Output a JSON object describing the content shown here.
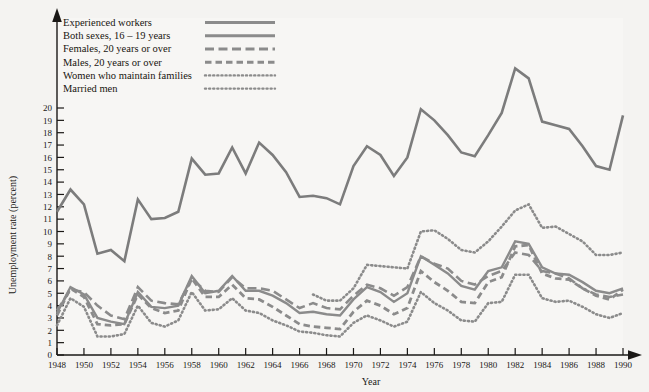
{
  "chart_data": {
    "type": "line",
    "title": "",
    "xlabel": "Year",
    "ylabel": "Unemployment rate (percent)",
    "xlim": [
      1948,
      1990
    ],
    "ylim": [
      0,
      20
    ],
    "grid": false,
    "legend_position": "top-left",
    "x_ticks": [
      1948,
      1950,
      1952,
      1954,
      1956,
      1958,
      1960,
      1962,
      1964,
      1966,
      1968,
      1970,
      1972,
      1974,
      1976,
      1978,
      1980,
      1982,
      1984,
      1986,
      1988,
      1990
    ],
    "y_ticks": [
      0,
      1,
      2,
      3,
      4,
      5,
      6,
      7,
      8,
      9,
      10,
      11,
      12,
      13,
      14,
      15,
      16,
      17,
      18,
      19,
      20
    ],
    "x": [
      1948,
      1949,
      1950,
      1951,
      1952,
      1953,
      1954,
      1955,
      1956,
      1957,
      1958,
      1959,
      1960,
      1961,
      1962,
      1963,
      1964,
      1965,
      1966,
      1967,
      1968,
      1969,
      1970,
      1971,
      1972,
      1973,
      1974,
      1975,
      1976,
      1977,
      1978,
      1979,
      1980,
      1981,
      1982,
      1983,
      1984,
      1985,
      1986,
      1987,
      1988,
      1989,
      1990
    ],
    "series": [
      {
        "name": "Both sexes, 16 – 19 years",
        "style": "solid",
        "color": "#7c7c7c",
        "width": 2.6,
        "values": [
          11.6,
          13.4,
          12.2,
          8.2,
          8.5,
          7.6,
          12.6,
          11.0,
          11.1,
          11.6,
          15.9,
          14.6,
          14.7,
          16.8,
          14.7,
          17.2,
          16.2,
          14.8,
          12.8,
          12.9,
          12.7,
          12.2,
          15.3,
          16.9,
          16.2,
          14.5,
          16.0,
          19.9,
          19.0,
          17.8,
          16.4,
          16.1,
          17.8,
          19.6,
          23.2,
          22.4,
          18.9,
          18.6,
          18.3,
          16.9,
          15.3,
          15.0,
          19.4
        ]
      },
      {
        "name": "Experienced workers",
        "style": "solid",
        "color": "#8b8b8b",
        "width": 2.4,
        "values": [
          3.4,
          5.5,
          4.9,
          3.0,
          2.7,
          2.5,
          5.1,
          3.9,
          3.8,
          4.0,
          6.4,
          5.0,
          5.2,
          6.4,
          5.2,
          5.2,
          4.8,
          4.2,
          3.4,
          3.5,
          3.3,
          3.2,
          4.5,
          5.5,
          5.1,
          4.3,
          5.0,
          8.0,
          7.3,
          6.6,
          5.6,
          5.3,
          6.8,
          7.1,
          9.2,
          9.0,
          7.1,
          6.6,
          6.5,
          5.9,
          5.2,
          5.0,
          5.4
        ]
      },
      {
        "name": "Females, 20 years or over",
        "style": "dashed-long",
        "color": "#8b8b8b",
        "width": 2.6,
        "values": [
          3.6,
          5.3,
          5.1,
          4.0,
          3.2,
          2.9,
          5.5,
          4.4,
          4.2,
          4.1,
          6.2,
          5.2,
          5.1,
          6.3,
          5.4,
          5.4,
          5.2,
          4.5,
          3.8,
          4.2,
          3.8,
          3.7,
          4.8,
          5.7,
          5.4,
          4.8,
          5.5,
          8.0,
          7.4,
          7.0,
          6.0,
          5.7,
          6.4,
          6.8,
          8.3,
          8.1,
          6.8,
          6.6,
          6.2,
          5.4,
          4.9,
          4.7,
          4.9
        ]
      },
      {
        "name": "Males, 20 years or over",
        "style": "dashed-short",
        "color": "#8b8b8b",
        "width": 2.8,
        "values": [
          3.2,
          5.4,
          4.7,
          2.5,
          2.4,
          2.5,
          4.9,
          3.8,
          3.4,
          3.6,
          6.2,
          4.7,
          4.7,
          5.7,
          4.6,
          4.5,
          3.9,
          3.2,
          2.5,
          2.3,
          2.2,
          2.1,
          3.5,
          4.4,
          4.0,
          3.3,
          3.8,
          6.8,
          5.9,
          5.2,
          4.3,
          4.2,
          5.9,
          6.3,
          8.8,
          8.9,
          6.6,
          6.2,
          6.1,
          5.4,
          4.8,
          4.5,
          5.3
        ]
      },
      {
        "name": "Women who maintain families",
        "style": "dotted",
        "color": "#8b8b8b",
        "width": 2.6,
        "start_year": 1967,
        "values": [
          null,
          null,
          null,
          null,
          null,
          null,
          null,
          null,
          null,
          null,
          null,
          null,
          null,
          null,
          null,
          null,
          null,
          null,
          null,
          4.9,
          4.4,
          4.4,
          5.4,
          7.3,
          7.2,
          7.1,
          7.0,
          10.0,
          10.1,
          9.4,
          8.5,
          8.3,
          9.2,
          10.4,
          11.7,
          12.2,
          10.3,
          10.4,
          9.8,
          9.2,
          8.1,
          8.1,
          8.3
        ]
      },
      {
        "name": "Married men",
        "style": "dotted",
        "color": "#8b8b8b",
        "width": 2.6,
        "values": [
          2.4,
          4.6,
          3.9,
          1.5,
          1.5,
          1.7,
          4.0,
          2.6,
          2.3,
          2.8,
          5.1,
          3.6,
          3.7,
          4.6,
          3.6,
          3.4,
          2.8,
          2.4,
          1.9,
          1.8,
          1.6,
          1.5,
          2.6,
          3.2,
          2.8,
          2.3,
          2.7,
          5.1,
          4.2,
          3.6,
          2.8,
          2.7,
          4.2,
          4.3,
          6.5,
          6.5,
          4.6,
          4.3,
          4.4,
          3.9,
          3.3,
          3.0,
          3.4
        ]
      }
    ]
  },
  "legend": {
    "items": [
      {
        "label": "Experienced workers",
        "sample": "solid-thick"
      },
      {
        "label": "Both sexes, 16 – 19 years",
        "sample": "solid-thick"
      },
      {
        "label": "Females, 20 years or over",
        "sample": "dashed-long"
      },
      {
        "label": "Males, 20 years or over",
        "sample": "dashed-short"
      },
      {
        "label": "Women who maintain families",
        "sample": "dotted"
      },
      {
        "label": "Married men",
        "sample": "dotted"
      }
    ]
  },
  "colors": {
    "background": "#f4f3f1",
    "line": "#8b8b8b",
    "axis": "#1a1816",
    "text": "#1a1816"
  }
}
